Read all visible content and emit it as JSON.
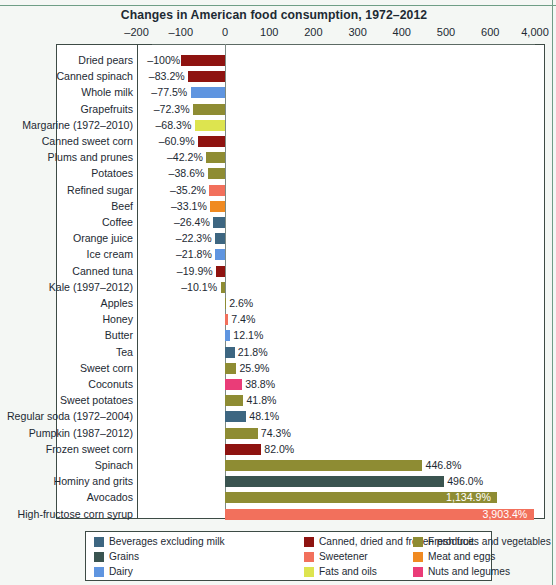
{
  "chart_data": {
    "type": "bar",
    "orientation": "horizontal",
    "title": "Changes in American food consumption, 1972–2012",
    "xlabel": "",
    "ylabel": "",
    "grid": true,
    "legend_position": "bottom",
    "axis_break": true,
    "axis_break_note": "Axis is broken between 600 and 4,000",
    "xticks": [
      {
        "label": "–200",
        "value": -200
      },
      {
        "label": "–100",
        "value": -100
      },
      {
        "label": "0",
        "value": 0
      },
      {
        "label": "100",
        "value": 100
      },
      {
        "label": "200",
        "value": 200
      },
      {
        "label": "300",
        "value": 300
      },
      {
        "label": "400",
        "value": 400
      },
      {
        "label": "500",
        "value": 500
      },
      {
        "label": "600",
        "value": 600
      },
      {
        "label": "4,000",
        "value": 4000
      }
    ],
    "xlim": [
      -200,
      4000
    ],
    "categories": [
      "Dried pears",
      "Canned spinach",
      "Whole milk",
      "Grapefruits",
      "Margarine (1972–2010)",
      "Canned sweet corn",
      "Plums and prunes",
      "Potatoes",
      "Refined sugar",
      "Beef",
      "Coffee",
      "Orange juice",
      "Ice cream",
      "Canned tuna",
      "Kale (1997–2012)",
      "Apples",
      "Honey",
      "Butter",
      "Tea",
      "Sweet corn",
      "Coconuts",
      "Sweet potatoes",
      "Regular soda (1972–2004)",
      "Pumpkin (1987–2012)",
      "Frozen sweet corn",
      "Spinach",
      "Hominy and grits",
      "Avocados",
      "High-fructose corn syrup"
    ],
    "values": [
      -100,
      -83.2,
      -77.5,
      -72.3,
      -68.3,
      -60.9,
      -42.2,
      -38.6,
      -35.2,
      -33.1,
      -26.4,
      -22.3,
      -21.8,
      -19.9,
      -10.1,
      2.6,
      7.4,
      12.1,
      21.8,
      25.9,
      38.8,
      41.8,
      48.1,
      74.3,
      82.0,
      446.8,
      496.0,
      1134.9,
      3903.4
    ],
    "value_labels": [
      "–100%",
      "–83.2%",
      "–77.5%",
      "–72.3%",
      "–68.3%",
      "–60.9%",
      "–42.2%",
      "–38.6%",
      "–35.2%",
      "–33.1%",
      "–26.4%",
      "–22.3%",
      "–21.8%",
      "–19.9%",
      "–10.1%",
      "2.6%",
      "7.4%",
      "12.1%",
      "21.8%",
      "25.9%",
      "38.8%",
      "41.8%",
      "48.1%",
      "74.3%",
      "82.0%",
      "446.8%",
      "496.0%",
      "1,134.9%",
      "3,903.4%"
    ],
    "category_group": [
      "canned-dried-frozen",
      "canned-dried-frozen",
      "dairy",
      "fresh-produce",
      "fats-and-oils",
      "canned-dried-frozen",
      "fresh-produce",
      "fresh-produce",
      "sweetener",
      "meat-and-eggs",
      "beverages",
      "beverages",
      "dairy",
      "canned-dried-frozen",
      "fresh-produce",
      "fresh-produce",
      "sweetener",
      "dairy",
      "beverages",
      "fresh-produce",
      "nuts-and-legumes",
      "fresh-produce",
      "beverages",
      "fresh-produce",
      "canned-dried-frozen",
      "fresh-produce",
      "grains",
      "fresh-produce",
      "sweetener"
    ]
  },
  "legend": {
    "entries": [
      {
        "label": "Beverages excluding milk",
        "key": "beverages",
        "color": "#3d6681"
      },
      {
        "label": "Canned, dried and frozen produce",
        "key": "canned-dried-frozen",
        "color": "#8e1310"
      },
      {
        "label": "Fresh fruits and vegetables",
        "key": "fresh-produce",
        "color": "#8e8c33"
      },
      {
        "label": "Grains",
        "key": "grains",
        "color": "#3a5450"
      },
      {
        "label": "Sweetener",
        "key": "sweetener",
        "color": "#f2705c"
      },
      {
        "label": "Meat and eggs",
        "key": "meat-and-eggs",
        "color": "#f08a21"
      },
      {
        "label": "Dairy",
        "key": "dairy",
        "color": "#5f95e0"
      },
      {
        "label": "Fats and oils",
        "key": "fats-and-oils",
        "color": "#dde44f"
      },
      {
        "label": "Nuts and legumes",
        "key": "nuts-and-legumes",
        "color": "#ea3c78"
      }
    ]
  },
  "colors": {
    "beverages": "#3d6681",
    "canned-dried-frozen": "#8e1310",
    "fresh-produce": "#8e8c33",
    "grains": "#3a5450",
    "sweetener": "#f2705c",
    "meat-and-eggs": "#f08a21",
    "dairy": "#5f95e0",
    "fats-and-oils": "#dde44f",
    "nuts-and-legumes": "#ea3c78",
    "frame": "#3d4b45",
    "grid": "#dfe5e4",
    "text": "#1d2a33",
    "page_rule": "#6f9e86"
  }
}
